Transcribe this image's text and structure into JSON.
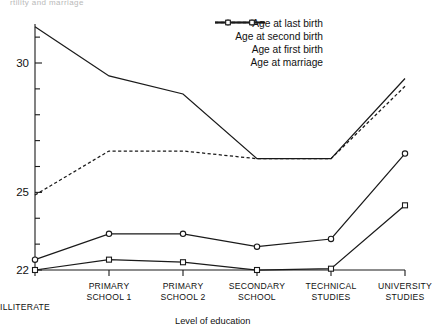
{
  "partial_title_fragment": "rtility and marriage",
  "axis": {
    "x_title": "Level of education",
    "y_ticks": [
      "22",
      "25",
      "30"
    ],
    "y_tick_values": [
      22,
      25,
      30
    ],
    "y_minor_count": 9
  },
  "legend": {
    "position": "top-right",
    "items": [
      {
        "label": "Age at last birth",
        "style": "solid",
        "marker": "none"
      },
      {
        "label": "Age at second birth",
        "style": "dashed",
        "marker": "none"
      },
      {
        "label": "Age at first birth",
        "style": "solid",
        "marker": "circle"
      },
      {
        "label": "Age at marriage",
        "style": "solid",
        "marker": "square"
      }
    ]
  },
  "categories_display": [
    "ILLITERATE",
    "PRIMARY\nSCHOOL 1",
    "PRIMARY\nSCHOOL 2",
    "SECONDARY\nSCHOOL",
    "TECHNICAL\nSTUDIES",
    "UNIVERSITY\nSTUDIES"
  ],
  "chart_data": {
    "type": "line",
    "title": "",
    "xlabel": "Level of education",
    "ylabel": "",
    "ylim": [
      22,
      31.8
    ],
    "grid": false,
    "legend_position": "top-right",
    "categories": [
      "ILLITERATE",
      "PRIMARY SCHOOL 1",
      "PRIMARY SCHOOL 2",
      "SECONDARY SCHOOL",
      "TECHNICAL STUDIES",
      "UNIVERSITY STUDIES"
    ],
    "series": [
      {
        "name": "Age at last birth",
        "style": "solid",
        "marker": "none",
        "values": [
          31.4,
          29.5,
          28.8,
          26.3,
          26.3,
          29.4
        ]
      },
      {
        "name": "Age at second birth",
        "style": "dashed",
        "marker": "none",
        "values": [
          24.9,
          26.6,
          26.6,
          26.3,
          26.3,
          29.1
        ]
      },
      {
        "name": "Age at first birth",
        "style": "solid",
        "marker": "circle",
        "values": [
          22.4,
          23.4,
          23.4,
          22.9,
          23.2,
          26.5
        ]
      },
      {
        "name": "Age at marriage",
        "style": "solid",
        "marker": "square",
        "values": [
          22.0,
          22.4,
          22.3,
          22.0,
          22.05,
          24.5
        ]
      }
    ]
  },
  "colors": {
    "line": "#1a1a1a",
    "axis": "#1a1a1a",
    "background": "#ffffff"
  }
}
